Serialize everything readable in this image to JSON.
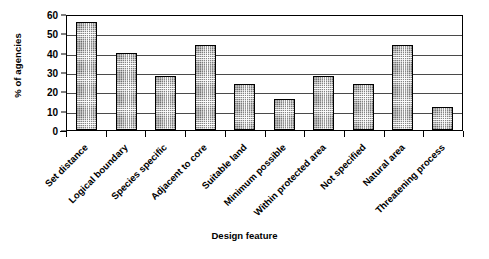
{
  "chart_data": {
    "type": "bar",
    "title": "",
    "xlabel": "Design feature",
    "ylabel": "% of agencies",
    "categories": [
      "Set distance",
      "Logical boundary",
      "Species specific",
      "Adjacent to core",
      "Suitable land",
      "Minimum possible",
      "Within protected area",
      "Not specified",
      "Natural area",
      "Threatening process"
    ],
    "values": [
      56,
      40,
      28,
      44,
      24,
      16,
      28,
      24,
      44,
      12
    ],
    "ylim": [
      0,
      60
    ],
    "yticks": [
      0,
      10,
      20,
      30,
      40,
      50,
      60
    ],
    "ytick_labels": [
      "0",
      "10",
      "20",
      "30",
      "40",
      "50",
      "60"
    ],
    "grid": true,
    "grid_axis": "y",
    "legend": false,
    "legend_position": "none",
    "bar_fill": "crosshatch",
    "bar_edge_color": "#000000",
    "bar_fill_color": "#5d5d5d",
    "background_color": "#ffffff"
  }
}
